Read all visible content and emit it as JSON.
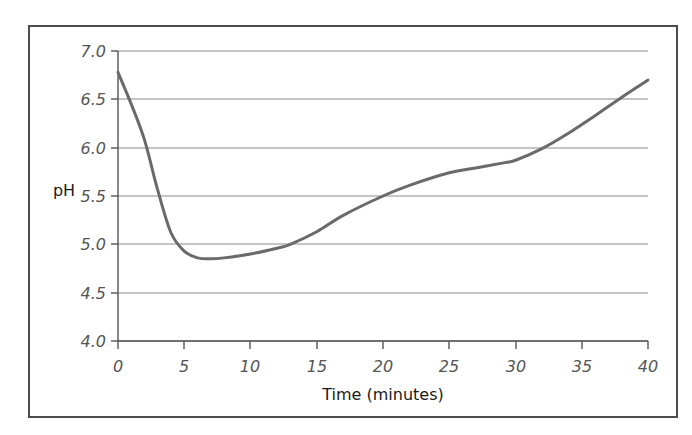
{
  "chart_data": {
    "type": "line",
    "title": "",
    "xlabel": "Time (minutes)",
    "ylabel": "pH",
    "xlim": [
      0,
      40
    ],
    "ylim": [
      4.0,
      7.0
    ],
    "xticks": [
      0,
      5,
      10,
      15,
      20,
      25,
      30,
      35,
      40
    ],
    "xtick_labels": [
      "0",
      "5",
      "10",
      "15",
      "20",
      "25",
      "30",
      "35",
      "40"
    ],
    "yticks": [
      4.0,
      4.5,
      5.0,
      5.5,
      6.0,
      6.5,
      7.0
    ],
    "ytick_labels": [
      "4.0",
      "4.5",
      "5.0",
      "5.5",
      "6.0",
      "6.5",
      "7.0"
    ],
    "grid": "horizontal",
    "legend": "none",
    "series": [
      {
        "name": "pH",
        "color": "#6a6a6a",
        "x": [
          0,
          1,
          2,
          3,
          4,
          5,
          6,
          7,
          8,
          10,
          12,
          13,
          15,
          17,
          20,
          22,
          25,
          27,
          29,
          30,
          32,
          34,
          36,
          38,
          40
        ],
        "values": [
          6.78,
          6.45,
          6.08,
          5.56,
          5.12,
          4.93,
          4.86,
          4.85,
          4.86,
          4.9,
          4.96,
          5.0,
          5.13,
          5.3,
          5.5,
          5.61,
          5.74,
          5.79,
          5.84,
          5.87,
          5.99,
          6.15,
          6.33,
          6.52,
          6.7
        ]
      }
    ]
  },
  "axis": {
    "y_title": "pH",
    "x_title": "Time (minutes)"
  },
  "colors": {
    "line": "#6a6a6a",
    "grid": "#8a8a8a",
    "axis": "#555555",
    "frame": "#4c4c4c",
    "text": "#1a1a1a",
    "tick_text": "#555555",
    "background": "#ffffff"
  }
}
